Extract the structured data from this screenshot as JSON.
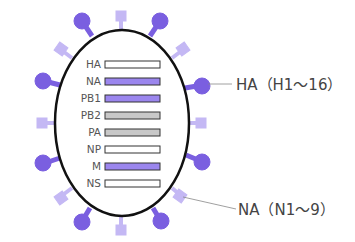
{
  "diagram": {
    "colors": {
      "ha_spike": "#7a5fe0",
      "na_spike": "#c4b8f4",
      "outline": "#111111",
      "bar_white": "#ffffff",
      "bar_purple": "#9b86ee",
      "bar_grey": "#c8c8c8"
    },
    "segments": [
      {
        "label": "HA",
        "fill": "white"
      },
      {
        "label": "NA",
        "fill": "purple"
      },
      {
        "label": "PB1",
        "fill": "purple"
      },
      {
        "label": "PB2",
        "fill": "grey"
      },
      {
        "label": "PA",
        "fill": "grey"
      },
      {
        "label": "NP",
        "fill": "white"
      },
      {
        "label": "M",
        "fill": "purple"
      },
      {
        "label": "NS",
        "fill": "white"
      }
    ],
    "callouts": {
      "ha": "HA（H1～16）",
      "na": "NA（N1～9）"
    },
    "spikes": {
      "ha_type": "round-knob-icon",
      "na_type": "square-box-icon"
    }
  }
}
